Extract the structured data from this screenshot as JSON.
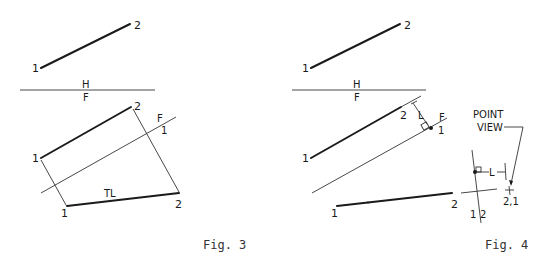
{
  "figures": [
    {
      "id": "fig3",
      "caption": "Fig. 3",
      "top_view": {
        "label_start": "1",
        "label_end": "2"
      },
      "fold_line_hf": {
        "upper": "H",
        "lower": "F"
      },
      "front_view": {
        "label_start": "1",
        "label_end": "2"
      },
      "fold_line_f1": {
        "upper": "F",
        "lower": "1"
      },
      "aux_view": {
        "label_start": "1",
        "label_end": "2",
        "tag": "TL"
      }
    },
    {
      "id": "fig4",
      "caption": "Fig. 4",
      "top_view": {
        "label_start": "1",
        "label_end": "2"
      },
      "fold_line_hf": {
        "upper": "H",
        "lower": "F"
      },
      "front_view": {
        "label_start": "1",
        "label_end": "2",
        "dimension": "L"
      },
      "fold_line_f1": {
        "upper": "F",
        "lower": "1"
      },
      "aux_view": {
        "label_start": "1",
        "label_end": "2"
      },
      "fold_line_12": {
        "left": "1",
        "right": "2"
      },
      "secondary_view": {
        "point_label": "2,1",
        "dimension": "L"
      },
      "callout": {
        "line1": "POINT",
        "line2": "VIEW"
      }
    }
  ],
  "colors": {
    "ink": "#1a1a1a",
    "background": "#ffffff"
  }
}
